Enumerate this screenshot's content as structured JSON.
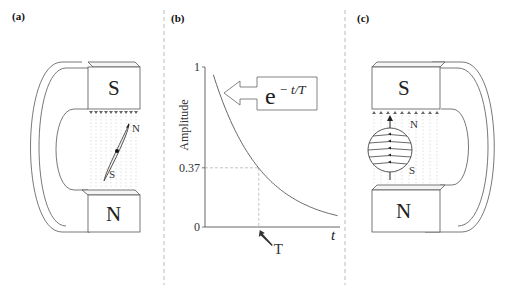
{
  "panels": {
    "a": {
      "label": "(a)",
      "magnet": {
        "top_pole": "S",
        "bottom_pole": "N"
      },
      "needle": {
        "north_label": "N",
        "south_label": "S"
      }
    },
    "b": {
      "label": "(b)",
      "formula": {
        "base": "e",
        "exponent": "− t/T"
      }
    },
    "c": {
      "label": "(c)",
      "magnet": {
        "top_pole": "S",
        "bottom_pole": "N"
      },
      "sphere": {
        "north_label": "N",
        "south_label": "S"
      }
    }
  },
  "chart_data": {
    "type": "line",
    "title": "",
    "xlabel": "t",
    "ylabel": "Amplitude",
    "function": "exp(-t/T)",
    "yticks": [
      {
        "value": 1,
        "label": "1"
      },
      {
        "value": 0.37,
        "label": "0.37"
      },
      {
        "value": 0,
        "label": "0"
      }
    ],
    "xmarker": {
      "value": 1,
      "label": "T",
      "unit": "T"
    },
    "xlim": [
      0,
      2.7
    ],
    "ylim": [
      0,
      1
    ],
    "x": [
      0.05,
      0.25,
      0.5,
      0.75,
      1.0,
      1.25,
      1.5,
      1.75,
      2.0,
      2.25,
      2.5,
      2.65
    ],
    "y": [
      0.95,
      0.78,
      0.61,
      0.47,
      0.37,
      0.29,
      0.22,
      0.17,
      0.14,
      0.11,
      0.08,
      0.07
    ],
    "reference_lines": [
      {
        "axis": "y",
        "value": 0.37,
        "style": "dashed"
      },
      {
        "axis": "x",
        "value": 1,
        "style": "dashed"
      }
    ],
    "grid": false,
    "legend": "none"
  },
  "colors": {
    "line": "#555555",
    "divider": "#aaaaaa",
    "field": "#bbbbbb"
  }
}
